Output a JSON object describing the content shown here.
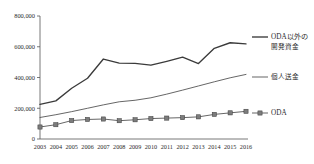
{
  "chart_data": {
    "type": "line",
    "title": "",
    "xlabel": "",
    "ylabel": "",
    "categories": [
      "2003",
      "2004",
      "2005",
      "2006",
      "2007",
      "2008",
      "2009",
      "2010",
      "2011",
      "2012",
      "2013",
      "2014",
      "2015",
      "2016"
    ],
    "ylim": [
      0,
      800000
    ],
    "yticks": [
      0,
      200000,
      400000,
      600000,
      800000
    ],
    "ytick_labels": [
      "0",
      "200,000",
      "400,000",
      "600,000",
      "800,000"
    ],
    "grid": false,
    "legend_position": "right",
    "series": [
      {
        "name": "ODA以外の開発資金",
        "marker": "none",
        "values": [
          225000,
          248000,
          330000,
          395000,
          520000,
          493000,
          492000,
          480000,
          505000,
          532000,
          491000,
          590000,
          626000,
          619000
        ]
      },
      {
        "name": "個人送金",
        "marker": "none",
        "values": [
          140000,
          158000,
          178000,
          200000,
          222000,
          242000,
          252000,
          268000,
          292000,
          318000,
          345000,
          372000,
          398000,
          420000
        ]
      },
      {
        "name": "ODA",
        "marker": "square",
        "values": [
          78000,
          93000,
          120000,
          127000,
          130000,
          119000,
          125000,
          133000,
          136000,
          139000,
          144000,
          160000,
          170000,
          180000
        ]
      }
    ]
  },
  "legend": {
    "items": [
      {
        "label_line1": "ODA以外の",
        "label_line2": "開発資金",
        "marker": "line"
      },
      {
        "label_line1": "個人送金",
        "label_line2": "",
        "marker": "line"
      },
      {
        "label_line1": "ODA",
        "label_line2": "",
        "marker": "line-square"
      }
    ]
  },
  "colors": {
    "series_a": "#3b3b3b",
    "series_b": "#4a4a4a",
    "series_c": "#4a4a4a",
    "marker_fill": "#7c7c7c",
    "axis": "#555555",
    "text": "#2b2b2b",
    "background": "#ffffff"
  }
}
